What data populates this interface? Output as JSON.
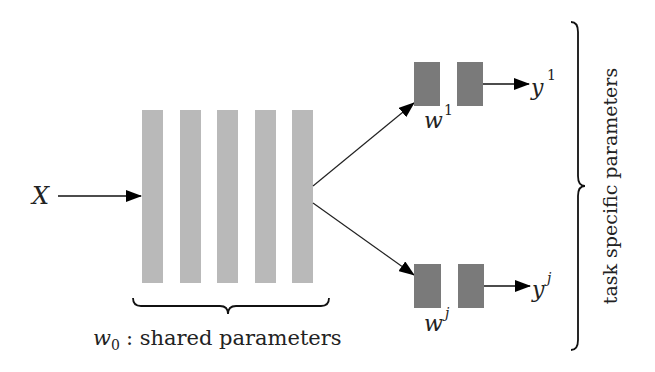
{
  "diagram": {
    "input": {
      "label": "X"
    },
    "shared": {
      "layer_count": 5,
      "color": "#b9b9b9",
      "label_var": "w",
      "label_sub": "0",
      "label_text": ": shared parameters"
    },
    "tasks": [
      {
        "weight_var": "w",
        "weight_sup": "1",
        "output_var": "y",
        "output_sup": "1"
      },
      {
        "weight_var": "w",
        "weight_sup": "j",
        "output_var": "y",
        "output_sup": "j"
      }
    ],
    "task_color": "#7a7a7a",
    "side_label": "task specific parameters"
  }
}
